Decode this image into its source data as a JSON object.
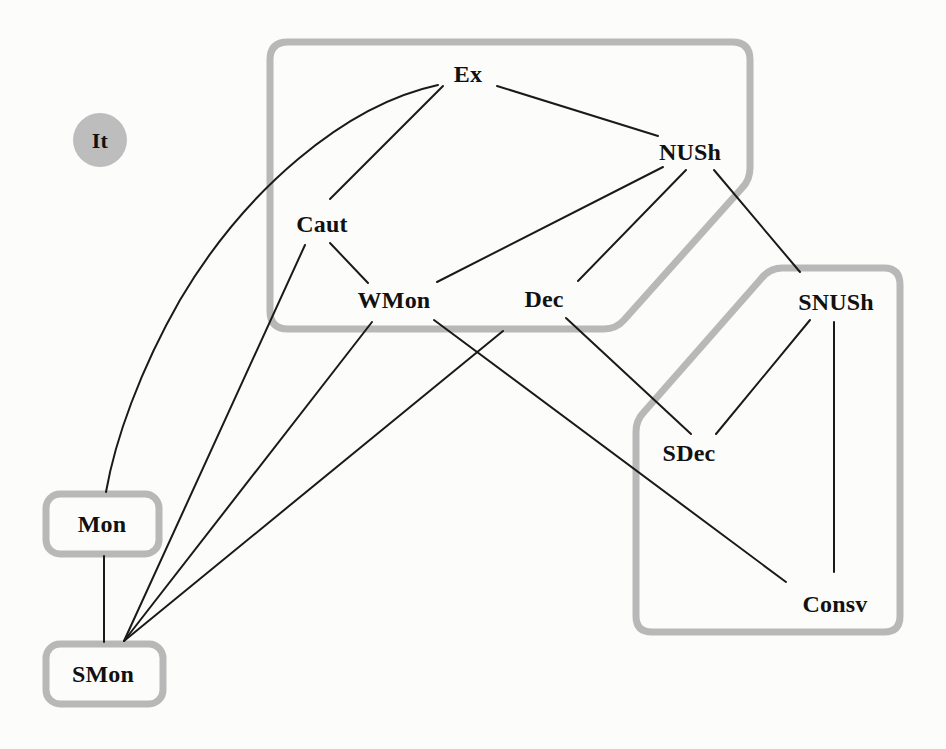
{
  "diagram": {
    "background_color": "#fcfcfb",
    "region_stroke_color": "#b8b8b8",
    "region_stroke_width": 7,
    "edge_color": "#1a1a1a",
    "edge_width": 2,
    "text_color": "#111111",
    "nodes": [
      {
        "id": "It",
        "label": "It",
        "x": 100,
        "y": 140,
        "shape": "filled-circle",
        "radius": 27,
        "fill": "#bdbdbd"
      },
      {
        "id": "Ex",
        "label": "Ex",
        "x": 468,
        "y": 74,
        "shape": "text"
      },
      {
        "id": "NUSh",
        "label": "NUSh",
        "x": 690,
        "y": 152,
        "shape": "text"
      },
      {
        "id": "Caut",
        "label": "Caut",
        "x": 322,
        "y": 224,
        "shape": "text"
      },
      {
        "id": "WMon",
        "label": "WMon",
        "x": 394,
        "y": 300,
        "shape": "text"
      },
      {
        "id": "Dec",
        "label": "Dec",
        "x": 544,
        "y": 299,
        "shape": "text"
      },
      {
        "id": "SNUSh",
        "label": "SNUSh",
        "x": 836,
        "y": 302,
        "shape": "text"
      },
      {
        "id": "SDec",
        "label": "SDec",
        "x": 689,
        "y": 453,
        "shape": "text"
      },
      {
        "id": "Consv",
        "label": "Consv",
        "x": 835,
        "y": 604,
        "shape": "text"
      },
      {
        "id": "Mon",
        "label": "Mon",
        "x": 102,
        "y": 524,
        "shape": "rounded-box"
      },
      {
        "id": "SMon",
        "label": "SMon",
        "x": 103,
        "y": 674,
        "shape": "rounded-box"
      }
    ],
    "regions": [
      {
        "id": "upper-region",
        "label": "upper grouping region"
      },
      {
        "id": "lower-right-region",
        "label": "lower right grouping region"
      },
      {
        "id": "mon-region",
        "label": "Mon grouping region"
      },
      {
        "id": "smon-region",
        "label": "SMon grouping region"
      }
    ],
    "edges": [
      {
        "from": "Ex",
        "to": "Caut",
        "kind": "straight"
      },
      {
        "from": "Ex",
        "to": "NUSh",
        "kind": "straight"
      },
      {
        "from": "Ex",
        "to": "Mon",
        "kind": "curved"
      },
      {
        "from": "NUSh",
        "to": "WMon",
        "kind": "straight"
      },
      {
        "from": "NUSh",
        "to": "Dec",
        "kind": "straight"
      },
      {
        "from": "NUSh",
        "to": "SNUSh",
        "kind": "straight"
      },
      {
        "from": "Caut",
        "to": "WMon",
        "kind": "straight"
      },
      {
        "from": "Caut",
        "to": "SMon",
        "kind": "straight"
      },
      {
        "from": "WMon",
        "to": "SMon",
        "kind": "straight"
      },
      {
        "from": "WMon",
        "to": "Consv",
        "kind": "straight"
      },
      {
        "from": "Dec",
        "to": "SMon",
        "kind": "straight"
      },
      {
        "from": "Dec",
        "to": "SDec",
        "kind": "straight"
      },
      {
        "from": "SNUSh",
        "to": "SDec",
        "kind": "straight"
      },
      {
        "from": "SNUSh",
        "to": "Consv",
        "kind": "straight"
      },
      {
        "from": "Mon",
        "to": "SMon",
        "kind": "straight"
      }
    ]
  }
}
